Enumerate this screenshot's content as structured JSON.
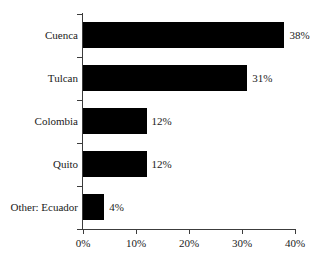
{
  "chart_data": {
    "type": "bar",
    "orientation": "horizontal",
    "title": "",
    "xlabel": "",
    "ylabel": "",
    "categories": [
      "Cuenca",
      "Tulcan",
      "Colombia",
      "Quito",
      "Other: Ecuador"
    ],
    "values": [
      38,
      31,
      12,
      12,
      4
    ],
    "value_labels": [
      "38%",
      "31%",
      "12%",
      "12%",
      "4%"
    ],
    "xlim": [
      0,
      40
    ],
    "xticks": [
      0,
      10,
      20,
      30,
      40
    ],
    "xtick_labels": [
      "0%",
      "10%",
      "20%",
      "30%",
      "40%"
    ],
    "grid": false,
    "legend": false,
    "bar_color": "#000000",
    "axis_color": "#3c3c3c",
    "background_color": "#ffffff"
  }
}
